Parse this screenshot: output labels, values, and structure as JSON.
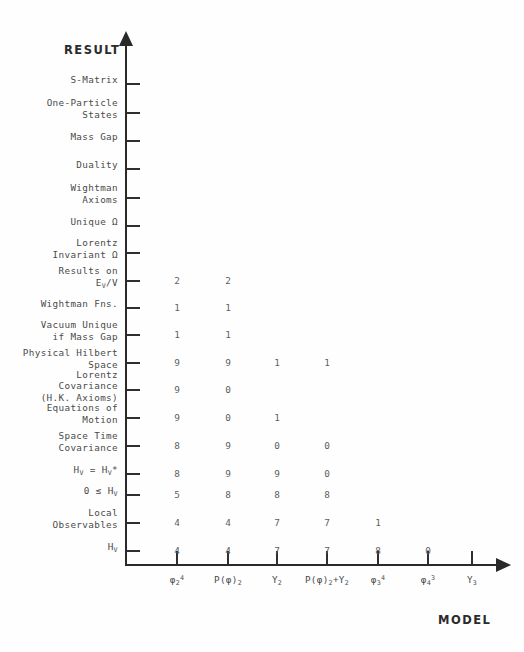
{
  "figure": {
    "y_axis_title": "RESULT",
    "x_axis_title": "MODEL"
  },
  "rows": [
    {
      "id": "s-matrix",
      "label": "S-Matrix",
      "y": 84
    },
    {
      "id": "one-particle-states",
      "label": "One-Particle\nStates",
      "y": 113
    },
    {
      "id": "mass-gap",
      "label": "Mass Gap",
      "y": 141
    },
    {
      "id": "duality",
      "label": "Duality",
      "y": 169
    },
    {
      "id": "wightman-axioms",
      "label": "Wightman\nAxioms",
      "y": 198
    },
    {
      "id": "unique-omega",
      "label": "Unique Ω",
      "y": 226
    },
    {
      "id": "lorentz-invariant-omega",
      "label": "Lorentz\nInvariant Ω",
      "y": 253
    },
    {
      "id": "results-on-ev-v",
      "label": "Results on\nE_V/V",
      "y": 281
    },
    {
      "id": "wightman-fns",
      "label": "Wightman Fns.",
      "y": 308
    },
    {
      "id": "vacuum-unique-if-mass-gap",
      "label": "Vacuum Unique\nif Mass Gap",
      "y": 335
    },
    {
      "id": "physical-hilbert-space",
      "label": "Physical Hilbert\nSpace",
      "y": 363
    },
    {
      "id": "lorentz-covariance",
      "label": "Lorentz\nCovariance\n(H.K. Axioms)",
      "y": 390
    },
    {
      "id": "equations-of-motion",
      "label": "Equations of\nMotion",
      "y": 418
    },
    {
      "id": "space-time-covariance",
      "label": "Space Time\nCovariance",
      "y": 446
    },
    {
      "id": "hv-self-adjoint",
      "label": "H_V = H_V*",
      "y": 474
    },
    {
      "id": "hv-positive",
      "label": "0 ≤ H_V",
      "y": 495
    },
    {
      "id": "local-observables",
      "label": "Local\nObservables",
      "y": 523
    },
    {
      "id": "hv",
      "label": "H_V",
      "y": 551
    }
  ],
  "columns": [
    {
      "id": "phi4-2",
      "label": "φ_2^4",
      "x": 177
    },
    {
      "id": "p-phi-2",
      "label": "P(φ)_2",
      "x": 228
    },
    {
      "id": "y-2",
      "label": "Y_2",
      "x": 277
    },
    {
      "id": "p-phi-2-plus-y-2",
      "label": "P(φ)_2+Y_2",
      "x": 327
    },
    {
      "id": "phi4-3",
      "label": "φ_3^4",
      "x": 378
    },
    {
      "id": "phi3-4",
      "label": "φ_4^3",
      "x": 428
    },
    {
      "id": "y-3",
      "label": "Y_3",
      "x": 472
    }
  ],
  "chart_data": {
    "type": "table",
    "title": "",
    "xlabel": "MODEL",
    "ylabel": "RESULT",
    "grid": false,
    "legend": "none",
    "categories": [
      "φ₂⁴",
      "P(φ)₂",
      "Y₂",
      "P(φ)₂+Y₂",
      "φ₃⁴",
      "φ₄³",
      "Y₃"
    ],
    "row_labels": [
      "S-Matrix",
      "One-Particle States",
      "Mass Gap",
      "Duality",
      "Wightman Axioms",
      "Unique Ω",
      "Lorentz Invariant Ω",
      "Results on E_V/V",
      "Wightman Fns.",
      "Vacuum Unique if Mass Gap",
      "Physical Hilbert Space",
      "Lorentz Covariance (H.K. Axioms)",
      "Equations of Motion",
      "Space Time Covariance",
      "H_V = H_V*",
      "0 ≤ H_V",
      "Local Observables",
      "H_V"
    ],
    "cells": [
      {
        "row": "S-Matrix",
        "values": [
          null,
          null,
          null,
          null,
          null,
          null,
          null
        ]
      },
      {
        "row": "One-Particle States",
        "values": [
          null,
          null,
          null,
          null,
          null,
          null,
          null
        ]
      },
      {
        "row": "Mass Gap",
        "values": [
          null,
          null,
          null,
          null,
          null,
          null,
          null
        ]
      },
      {
        "row": "Duality",
        "values": [
          null,
          null,
          null,
          null,
          null,
          null,
          null
        ]
      },
      {
        "row": "Wightman Axioms",
        "values": [
          null,
          null,
          null,
          null,
          null,
          null,
          null
        ]
      },
      {
        "row": "Unique Ω",
        "values": [
          null,
          null,
          null,
          null,
          null,
          null,
          null
        ]
      },
      {
        "row": "Lorentz Invariant Ω",
        "values": [
          null,
          null,
          null,
          null,
          null,
          null,
          null
        ]
      },
      {
        "row": "Results on E_V/V",
        "values": [
          "2",
          "2",
          null,
          null,
          null,
          null,
          null
        ]
      },
      {
        "row": "Wightman Fns.",
        "values": [
          "1",
          "1",
          null,
          null,
          null,
          null,
          null
        ]
      },
      {
        "row": "Vacuum Unique if Mass Gap",
        "values": [
          "1",
          "1",
          null,
          null,
          null,
          null,
          null
        ]
      },
      {
        "row": "Physical Hilbert Space",
        "values": [
          "9",
          "9",
          "1",
          "1",
          null,
          null,
          null
        ]
      },
      {
        "row": "Lorentz Covariance (H.K. Axioms)",
        "values": [
          "9",
          "0",
          null,
          null,
          null,
          null,
          null
        ]
      },
      {
        "row": "Equations of Motion",
        "values": [
          "9",
          "0",
          "1",
          null,
          null,
          null,
          null
        ]
      },
      {
        "row": "Space Time Covariance",
        "values": [
          "8",
          "9",
          "0",
          "0",
          null,
          null,
          null
        ]
      },
      {
        "row": "H_V = H_V*",
        "values": [
          "8",
          "9",
          "9",
          "0",
          null,
          null,
          null
        ]
      },
      {
        "row": "0 ≤ H_V",
        "values": [
          "5",
          "8",
          "8",
          "8",
          null,
          null,
          null
        ]
      },
      {
        "row": "Local Observables",
        "values": [
          "4",
          "4",
          "7",
          "7",
          "1",
          null,
          null
        ]
      },
      {
        "row": "H_V",
        "values": [
          "4",
          "4",
          "7",
          "7",
          "8",
          "0",
          null
        ]
      }
    ]
  }
}
